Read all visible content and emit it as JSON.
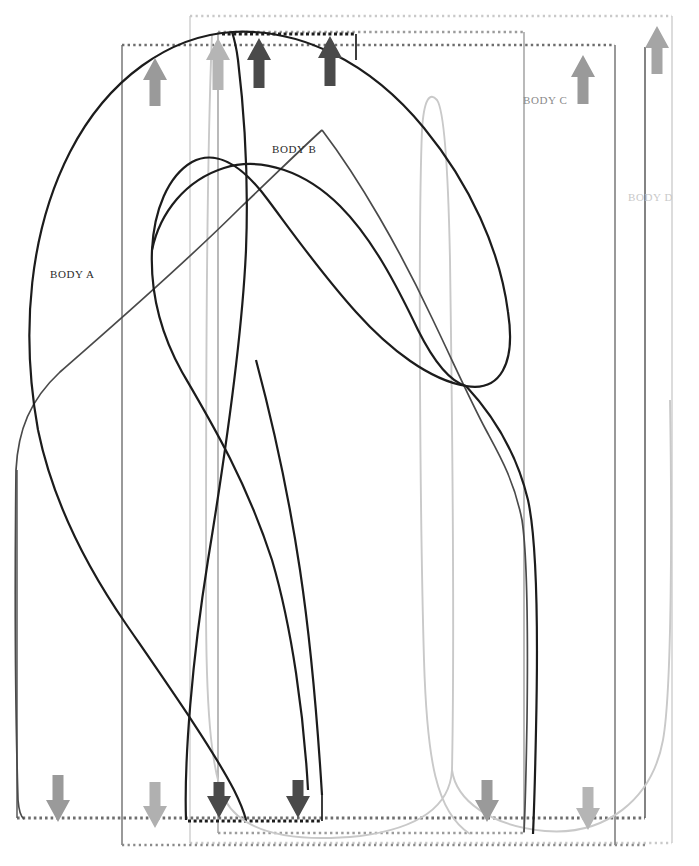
{
  "diagram": {
    "background": "#ffffff",
    "width": 699,
    "height": 866
  },
  "bodies": [
    {
      "id": "a",
      "label": "BODY A",
      "color": "#5a5a5a",
      "label_color": "#2b2b2b",
      "label_x": 50,
      "label_y": 268,
      "box": {
        "left": 17,
        "right": 645,
        "top": 47,
        "bottom": 818
      },
      "box_style": "solid-sides-dotted-top-bottom",
      "arrow_up": {
        "x": 58,
        "y": 78,
        "color": "#9a9a9a"
      },
      "arrow_down": {
        "x": 58,
        "y": 803,
        "color": "#9a9a9a"
      }
    },
    {
      "id": "b",
      "label": "BODY B",
      "color": "#2b2b2b",
      "label_color": "#2b2b2b",
      "label_x": 272,
      "label_y": 152,
      "box": {
        "left": 122,
        "right": 615,
        "top": 45,
        "bottom": 845
      },
      "box_style": "solid-sides-dotted-top-bottom",
      "arrow_up": {
        "x": 155,
        "y": 78,
        "color": "#9a9a9a"
      },
      "arrow_down": {
        "x": 155,
        "y": 803,
        "color": "#9a9a9a"
      }
    },
    {
      "id": "c",
      "label": "BODY C",
      "color": "#7d7d7d",
      "label_color": "#8a8a8a",
      "label_x": 523,
      "label_y": 102,
      "box": {
        "left": 218,
        "right": 524,
        "top": 32,
        "bottom": 833
      },
      "box_style": "solid-sides-dotted-top-bottom",
      "arrow_up": {
        "x": 218,
        "y": 62,
        "color": "#b5b5b5"
      },
      "arrow_down": {
        "x": 486,
        "y": 803,
        "color": "#9a9a9a"
      }
    },
    {
      "id": "d",
      "label": "BODY D",
      "color": "#c9c9c9",
      "label_color": "#c9c9c9",
      "label_x": 628,
      "label_y": 199,
      "box": {
        "left": 190,
        "right": 672,
        "top": 16,
        "bottom": 843
      },
      "box_style": "solid-sides-dotted-top-bottom",
      "arrow_up": {
        "x": 657,
        "y": 44,
        "color": "#b5b5b5"
      },
      "arrow_down": {
        "x": 588,
        "y": 803,
        "color": "#b5b5b5"
      }
    }
  ],
  "arrows": {
    "up": [
      {
        "name": "arrow-up-1",
        "x": 155,
        "y": 78,
        "color": "#9a9a9a",
        "size": 1.0
      },
      {
        "name": "arrow-up-2",
        "x": 218,
        "y": 62,
        "color": "#b5b5b5",
        "size": 1.0
      },
      {
        "name": "arrow-up-3",
        "x": 259,
        "y": 60,
        "color": "#4a4a4a",
        "size": 1.0
      },
      {
        "name": "arrow-up-4",
        "x": 330,
        "y": 58,
        "color": "#4a4a4a",
        "size": 1.0
      },
      {
        "name": "arrow-up-5",
        "x": 583,
        "y": 75,
        "color": "#9a9a9a",
        "size": 1.0
      },
      {
        "name": "arrow-up-6",
        "x": 657,
        "y": 44,
        "color": "#a5a5a5",
        "size": 1.0
      }
    ],
    "down": [
      {
        "name": "arrow-down-1",
        "x": 58,
        "y": 805,
        "color": "#9a9a9a",
        "size": 1.0
      },
      {
        "name": "arrow-down-2",
        "x": 155,
        "y": 806,
        "color": "#b0b0b0",
        "size": 1.0
      },
      {
        "name": "arrow-down-3",
        "x": 219,
        "y": 797,
        "color": "#4a4a4a",
        "size": 1.0
      },
      {
        "name": "arrow-down-4",
        "x": 298,
        "y": 796,
        "color": "#4a4a4a",
        "size": 1.0
      },
      {
        "name": "arrow-down-5",
        "x": 487,
        "y": 803,
        "color": "#9a9a9a",
        "size": 1.0
      },
      {
        "name": "arrow-down-6",
        "x": 588,
        "y": 807,
        "color": "#b5b5b5",
        "size": 1.0
      }
    ]
  },
  "curves": [
    {
      "name": "outline-black-main",
      "color": "#1c1c1c",
      "width": 2.1,
      "description": "large black closed outline sweeping from lower-left up over the top and down the right side into the lower lobe"
    },
    {
      "name": "outline-black-inner",
      "color": "#1c1c1c",
      "width": 2.1,
      "description": "inner black loop from upper centre curving right and down"
    },
    {
      "name": "outline-darkgray",
      "color": "#4a4a4a",
      "width": 1.6,
      "description": "dark grey curve from lower-left rising to the right and descending to bottom-right"
    },
    {
      "name": "outline-lightgray-left",
      "color": "#c9c9c9",
      "width": 1.8,
      "description": "light grey narrow lobe on the left-centre descending to bottom"
    },
    {
      "name": "outline-lightgray-right",
      "color": "#c9c9c9",
      "width": 1.8,
      "description": "light grey tall thin lobe on the right-centre descending to bottom"
    }
  ],
  "legend_note": ""
}
